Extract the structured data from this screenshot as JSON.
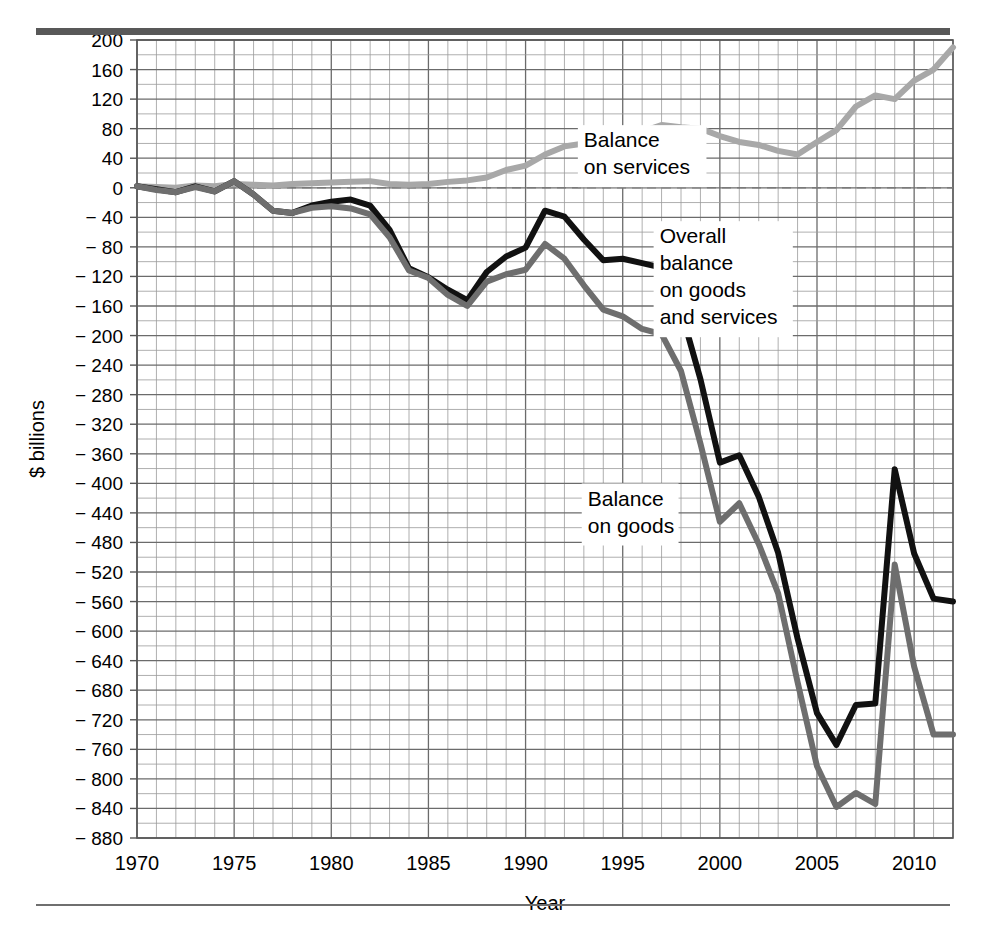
{
  "figure": {
    "title": "",
    "top_rule_color": "#585858",
    "bottom_rule_color": "#6f6f6f"
  },
  "axes": {
    "ylabel": "$ billions",
    "xlabel": "Year",
    "ytick_labels": [
      "200",
      "160",
      "120",
      "80",
      "40",
      "0",
      "− 40",
      "− 80",
      "− 120",
      "− 160",
      "− 200",
      "− 240",
      "− 280",
      "− 320",
      "− 360",
      "− 400",
      "− 440",
      "− 480",
      "− 520",
      "− 560",
      "− 600",
      "− 640",
      "− 680",
      "− 720",
      "− 760",
      "− 800",
      "− 840",
      "− 880"
    ],
    "xtick_labels": [
      "1970",
      "1975",
      "1980",
      "1985",
      "1990",
      "1995",
      "2000",
      "2005",
      "2010"
    ]
  },
  "annotations": [
    {
      "id": "services-label",
      "lines": [
        "Balance",
        "on services"
      ],
      "x": 1993.0,
      "y": 55
    },
    {
      "id": "overall-label",
      "lines": [
        "Overall",
        "balance",
        "on goods",
        "and services"
      ],
      "x": 1996.9,
      "y": -75
    },
    {
      "id": "goods-label",
      "lines": [
        "Balance",
        "on goods"
      ],
      "x": 1993.2,
      "y": -430
    }
  ],
  "chart_data": {
    "type": "line",
    "title": "",
    "xlabel": "Year",
    "ylabel": "$ billions",
    "xlim": [
      1970,
      2012
    ],
    "ylim": [
      -880,
      200
    ],
    "ytick_step": 40,
    "xtick_step": 5,
    "grid": true,
    "grid_minor_x_step": 1,
    "grid_minor_y_step": 20,
    "legend": "annotations-inline",
    "x": [
      1970,
      1971,
      1972,
      1973,
      1974,
      1975,
      1976,
      1977,
      1978,
      1979,
      1980,
      1981,
      1982,
      1983,
      1984,
      1985,
      1986,
      1987,
      1988,
      1989,
      1990,
      1991,
      1992,
      1993,
      1994,
      1995,
      1996,
      1997,
      1998,
      1999,
      2000,
      2001,
      2002,
      2003,
      2004,
      2005,
      2006,
      2007,
      2008,
      2009,
      2010,
      2011,
      2012
    ],
    "series": [
      {
        "name": "Balance on services",
        "color": "#a8a8a8",
        "width": 6,
        "values": [
          2,
          1,
          0,
          3,
          2,
          5,
          4,
          3,
          5,
          6,
          7,
          8,
          9,
          5,
          4,
          5,
          8,
          10,
          14,
          24,
          30,
          45,
          56,
          60,
          64,
          68,
          76,
          85,
          82,
          80,
          70,
          62,
          58,
          50,
          45,
          62,
          78,
          110,
          125,
          120,
          145,
          160,
          190
        ]
      },
      {
        "name": "Overall balance on goods and services",
        "color": "#111111",
        "width": 6,
        "values": [
          2,
          -2,
          -6,
          2,
          -5,
          9,
          -9,
          -31,
          -34,
          -24,
          -19,
          -16,
          -24,
          -57,
          -109,
          -121,
          -138,
          -152,
          -114,
          -93,
          -81,
          -31,
          -39,
          -70,
          -98,
          -96,
          -102,
          -108,
          -166,
          -259,
          -372,
          -362,
          -418,
          -494,
          -610,
          -711,
          -754,
          -700,
          -698,
          -381,
          -495,
          -556,
          -560
        ]
      },
      {
        "name": "Balance on goods",
        "color": "#6e6e6e",
        "width": 6,
        "values": [
          2,
          -3,
          -6,
          1,
          -5,
          9,
          -9,
          -31,
          -34,
          -27,
          -25,
          -28,
          -36,
          -67,
          -112,
          -122,
          -145,
          -160,
          -127,
          -117,
          -111,
          -76,
          -96,
          -132,
          -165,
          -174,
          -191,
          -198,
          -248,
          -346,
          -452,
          -427,
          -482,
          -549,
          -669,
          -783,
          -838,
          -819,
          -834,
          -510,
          -648,
          -740,
          -740
        ]
      }
    ]
  }
}
